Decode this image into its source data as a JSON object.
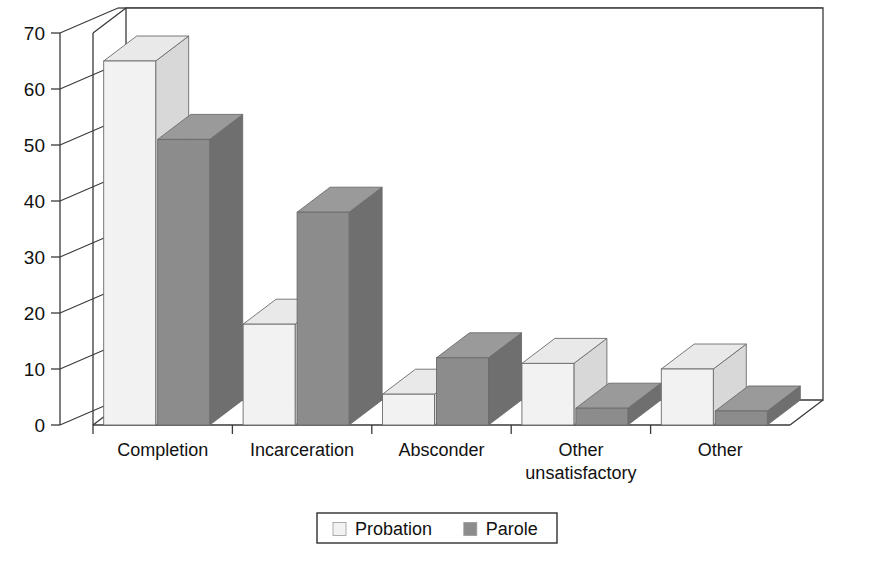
{
  "chart_data": {
    "type": "bar",
    "title": "",
    "subtitle": "",
    "xlabel": "",
    "ylabel": "",
    "ylim": [
      0,
      70
    ],
    "ytick_step": 10,
    "yticks": [
      "0",
      "10",
      "20",
      "30",
      "40",
      "50",
      "60",
      "70"
    ],
    "grid": true,
    "three_d": true,
    "legend_position": "bottom-center",
    "categories": [
      "Completion",
      "Incarceration",
      "Absconder",
      "Other unsatisfactory",
      "Other"
    ],
    "category_lines": [
      [
        "Completion"
      ],
      [
        "Incarceration"
      ],
      [
        "Absconder"
      ],
      [
        "Other",
        "unsatisfactory"
      ],
      [
        "Other"
      ]
    ],
    "series": [
      {
        "name": "Probation",
        "color": "#f2f2f2",
        "top_color": "#e9e9e9",
        "side_color": "#d8d8d8",
        "values": [
          65,
          18,
          5.5,
          11,
          10
        ]
      },
      {
        "name": "Parole",
        "color": "#8c8c8c",
        "top_color": "#9a9a9a",
        "side_color": "#6f6f6f",
        "values": [
          51,
          38,
          12,
          3,
          2.5
        ]
      }
    ]
  },
  "legend": {
    "items": [
      {
        "label": "Probation",
        "swatch": "#f2f2f2"
      },
      {
        "label": "Parole",
        "swatch": "#8c8c8c"
      }
    ]
  },
  "colors": {
    "background": "#ffffff",
    "axis": "#3a3a3a",
    "gridline": "#4d4d4d",
    "text": "#111111"
  }
}
